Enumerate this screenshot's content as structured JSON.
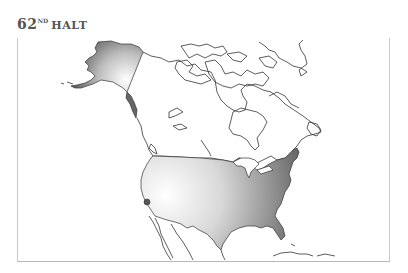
{
  "header": {
    "number": "62",
    "ordinal_suffix": "ND",
    "title": "HALT"
  },
  "map": {
    "region": "North America",
    "highlighted_regions": [
      {
        "name": "Contiguous United States",
        "fill": "gradient",
        "gradient_light": "#ffffff",
        "gradient_dark": "#555555"
      },
      {
        "name": "Alaska",
        "fill": "gradient",
        "gradient_light": "#f4f4f4",
        "gradient_dark": "#666666"
      }
    ],
    "marker": {
      "label": "location-marker",
      "color": "#555555"
    },
    "outline_color": "#333333",
    "frame_border_color": "#c8c8c8"
  }
}
